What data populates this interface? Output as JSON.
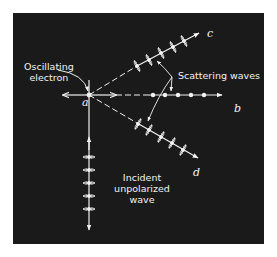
{
  "colors": {
    "background": "#ffffff",
    "panel": "#1a1a1a",
    "foreground": "#f2f2f2"
  },
  "labels": {
    "oscillating_electron_line1": "Oscillating",
    "oscillating_electron_line2": "electron",
    "point_a": "a",
    "ray_b": "b",
    "ray_c": "c",
    "ray_d": "d",
    "scattering_waves": "Scattering waves",
    "incident_line1": "Incident",
    "incident_line2": "unpolarized",
    "incident_line3": "wave"
  },
  "diagram": {
    "origin_point": "a",
    "rays": [
      {
        "id": "b",
        "direction": "horizontal-right",
        "polarization_marker": "dots (perpendicular to page)",
        "marker_count": 5
      },
      {
        "id": "c",
        "direction": "upper-right",
        "polarization_marker": "double arrows perpendicular to ray",
        "marker_count": 5
      },
      {
        "id": "d",
        "direction": "lower-right",
        "polarization_marker": "double arrows perpendicular to ray",
        "marker_count": 5
      }
    ],
    "incident_wave": {
      "direction": "vertical",
      "polarization_marker": "horizontal double arrows with dots",
      "marker_count": 5
    },
    "electron_oscillation_arrows": "horizontal double arrow and vertical line through a"
  }
}
